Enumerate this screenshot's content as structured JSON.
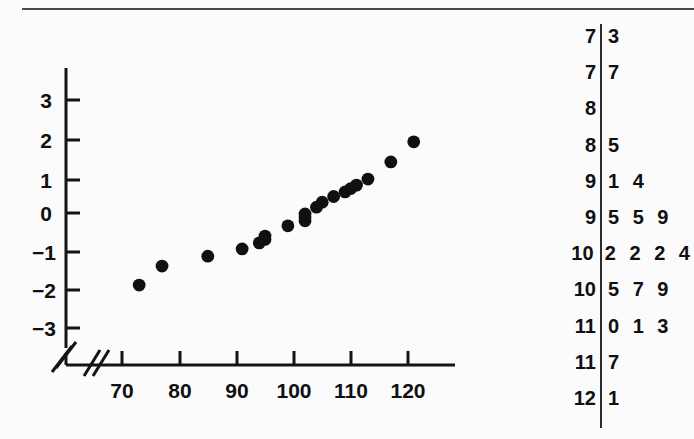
{
  "figure": {
    "kind": "normal-probability-plot-with-stem-and-leaf",
    "background_color": "#fbfbfc",
    "ink_color": "#101010"
  },
  "chart_data": [
    {
      "type": "scatter",
      "title": "",
      "subtitle": "",
      "xlabel": "",
      "ylabel": "",
      "xlim": [
        66,
        126
      ],
      "ylim": [
        -3.6,
        3.6
      ],
      "xticks": [
        70,
        80,
        90,
        100,
        110,
        120
      ],
      "yticks": [
        3,
        2,
        1,
        0,
        -1,
        -2,
        -3
      ],
      "xtick_labels": [
        "70",
        "80",
        "90",
        "100",
        "110",
        "120"
      ],
      "ytick_labels": [
        "3",
        "2",
        "1",
        "0",
        "−1",
        "−2",
        "−3"
      ],
      "grid": false,
      "legend": "none",
      "axis_break_x": true,
      "axis_break_y": true,
      "annotations": [
        "axis-break-slash-x",
        "axis-break-slash-y"
      ],
      "x": [
        73,
        77,
        85,
        91,
        94,
        95,
        95,
        99,
        102,
        102,
        102,
        104,
        105,
        107,
        109,
        110,
        111,
        113,
        117,
        121
      ],
      "y": [
        -1.87,
        -1.37,
        -1.11,
        -0.92,
        -0.76,
        -0.67,
        -0.58,
        -0.31,
        -0.18,
        -0.09,
        0.0,
        0.18,
        0.31,
        0.46,
        0.58,
        0.67,
        0.76,
        0.92,
        1.37,
        1.9
      ],
      "series": [
        {
          "name": "normal scores",
          "values": [
            -1.87,
            -1.37,
            -1.11,
            -0.92,
            -0.76,
            -0.67,
            -0.58,
            -0.31,
            -0.18,
            -0.09,
            0.0,
            0.18,
            0.31,
            0.46,
            0.58,
            0.67,
            0.76,
            0.92,
            1.37,
            1.9
          ]
        }
      ],
      "marker": "filled-circle",
      "marker_color": "#101010",
      "n": 20
    },
    {
      "type": "table",
      "title": "",
      "subtitle": "stem-and-leaf display",
      "xlabel": "",
      "ylabel": "",
      "grid": false,
      "legend": "none",
      "stem_unit": "tens",
      "rows": [
        {
          "stem": "7",
          "leaves": [
            "3"
          ]
        },
        {
          "stem": "7",
          "leaves": [
            "7"
          ]
        },
        {
          "stem": "8",
          "leaves": []
        },
        {
          "stem": "8",
          "leaves": [
            "5"
          ]
        },
        {
          "stem": "9",
          "leaves": [
            "1",
            "4"
          ]
        },
        {
          "stem": "9",
          "leaves": [
            "5",
            "5",
            "9"
          ]
        },
        {
          "stem": "10",
          "leaves": [
            "2",
            "2",
            "2",
            "4"
          ]
        },
        {
          "stem": "10",
          "leaves": [
            "5",
            "7",
            "9"
          ]
        },
        {
          "stem": "11",
          "leaves": [
            "0",
            "1",
            "3"
          ]
        },
        {
          "stem": "11",
          "leaves": [
            "7"
          ]
        },
        {
          "stem": "12",
          "leaves": [
            "1"
          ]
        }
      ],
      "values": [
        73,
        77,
        85,
        91,
        94,
        95,
        95,
        99,
        102,
        102,
        102,
        104,
        105,
        107,
        109,
        110,
        111,
        113,
        117,
        121
      ],
      "n": 20
    }
  ]
}
